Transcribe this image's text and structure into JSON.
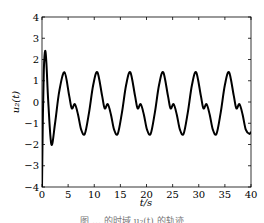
{
  "chart_data": {
    "type": "line",
    "title": "",
    "xlabel": "t/s",
    "ylabel": "u₂(t)",
    "xlim": [
      0,
      40
    ],
    "ylim": [
      -4,
      4
    ],
    "xticks": [
      0,
      5,
      10,
      15,
      20,
      25,
      30,
      35,
      40
    ],
    "yticks": [
      -4,
      -3,
      -2,
      -1,
      0,
      1,
      2,
      3,
      4
    ],
    "grid": false,
    "legend": null,
    "series": [
      {
        "name": "u2(t)",
        "color": "#000000",
        "x": [
          0,
          0.15,
          0.35,
          0.6,
          0.85,
          1.2,
          1.8,
          2.5,
          3.3,
          4.3,
          5.2,
          5.7,
          6.3,
          6.9,
          7.5,
          8.2,
          9.0,
          9.8,
          10.6,
          11.5,
          12.0,
          12.6,
          13.2,
          13.8,
          14.5,
          15.3,
          16.1,
          16.9,
          17.8,
          18.3,
          18.9,
          19.5,
          20.1,
          20.8,
          21.6,
          22.4,
          23.2,
          24.1,
          24.6,
          25.2,
          25.8,
          26.4,
          27.1,
          27.9,
          28.7,
          29.5,
          30.4,
          30.9,
          31.5,
          32.1,
          32.7,
          33.4,
          34.2,
          35.0,
          35.8,
          36.7,
          37.2,
          37.8,
          38.4,
          39.0,
          39.7,
          40.0
        ],
        "y": [
          -4.0,
          -1.0,
          1.5,
          2.4,
          1.8,
          0.0,
          -2.0,
          -1.0,
          0.5,
          1.4,
          0.3,
          -0.3,
          -0.1,
          -0.6,
          -1.3,
          -1.5,
          -0.5,
          0.8,
          1.4,
          0.3,
          -0.3,
          -0.1,
          -0.6,
          -1.3,
          -1.5,
          -0.5,
          0.8,
          1.4,
          0.3,
          -0.3,
          -0.1,
          -0.6,
          -1.3,
          -1.5,
          -0.5,
          0.8,
          1.4,
          0.3,
          -0.3,
          -0.1,
          -0.6,
          -1.3,
          -1.5,
          -0.5,
          0.8,
          1.4,
          0.3,
          -0.3,
          -0.1,
          -0.6,
          -1.3,
          -1.5,
          -0.5,
          0.8,
          1.4,
          0.3,
          -0.3,
          -0.1,
          -0.6,
          -1.3,
          -1.5,
          -1.4
        ]
      }
    ]
  },
  "caption": "图 … 的时域 u₂(t) 的轨迹"
}
